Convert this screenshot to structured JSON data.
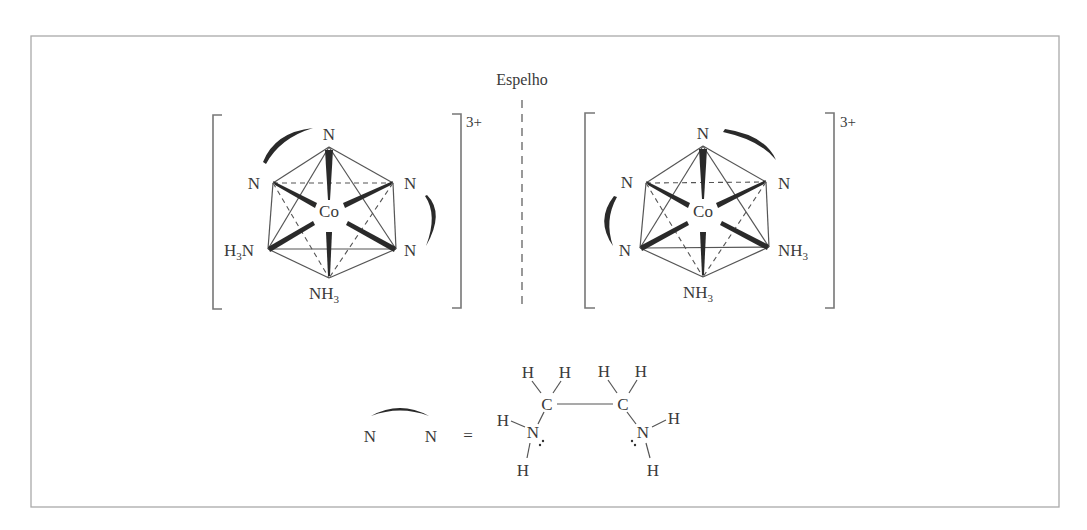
{
  "figure": {
    "mirror_label": "Espelho",
    "left_complex": {
      "charge": "3+",
      "metal": "Co",
      "ligands": {
        "top": "N",
        "upper_left": "N",
        "upper_right": "N",
        "lower_left": "H3N",
        "lower_right": "N",
        "bottom": "NH3"
      }
    },
    "right_complex": {
      "charge": "3+",
      "metal": "Co",
      "ligands": {
        "top": "N",
        "upper_left": "N",
        "upper_right": "N",
        "lower_left": "N",
        "lower_right": "NH3",
        "bottom": "NH3"
      }
    },
    "legend": {
      "bidentate_left": "N",
      "bidentate_right": "N",
      "equals": "=",
      "ethylenediamine": {
        "carbon_left": "C",
        "carbon_right": "C",
        "nitrogen_left": "N",
        "nitrogen_right": "N",
        "hydrogen": "H"
      }
    }
  }
}
